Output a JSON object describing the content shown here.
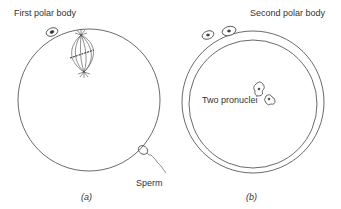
{
  "panel_a": {
    "label_polar_body": "First polar body",
    "label_sperm": "Sperm",
    "caption": "(a)"
  },
  "panel_b": {
    "label_polar_body": "Second polar body",
    "label_pronuclei": "Two pronuclei",
    "caption": "(b)"
  },
  "colors": {
    "line": "#444444",
    "background": "#ffffff"
  }
}
